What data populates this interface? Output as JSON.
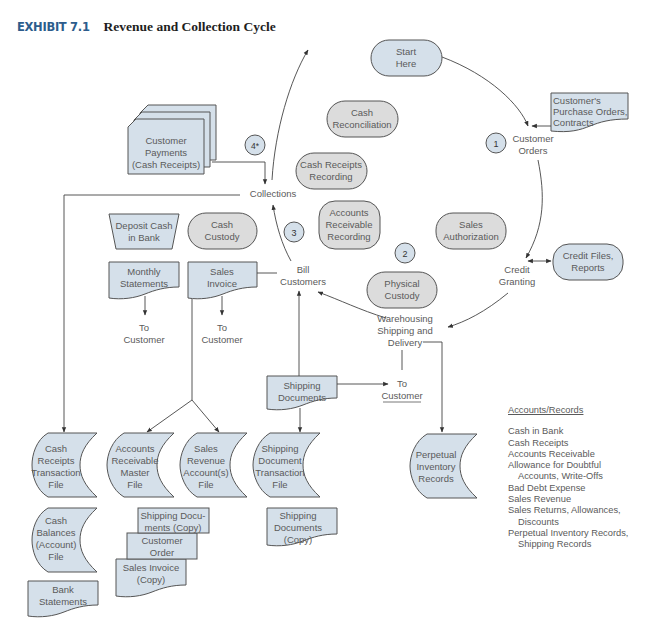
{
  "header": {
    "exhibit_label": "EXHIBIT 7.1",
    "title": "Revenue and Collection Cycle"
  },
  "colors": {
    "exhibit_blue": "#2c5c8c",
    "document_fill": "#d5e0ea",
    "process_fill": "#dcdcdc",
    "line": "#444444",
    "text": "#5a5a5a"
  },
  "cycle_steps": {
    "start": [
      "Start",
      "Here"
    ],
    "customer_orders": [
      "Customer",
      "Orders"
    ],
    "credit_granting": [
      "Credit",
      "Granting"
    ],
    "warehousing": [
      "Warehousing",
      "Shipping and",
      "Delivery"
    ],
    "bill_customers": [
      "Bill",
      "Customers"
    ],
    "collections": "Collections"
  },
  "step_numbers": {
    "n1": "1",
    "n2": "2",
    "n3": "3",
    "n4": "4*"
  },
  "functions": {
    "cash_reconciliation": [
      "Cash",
      "Reconciliation"
    ],
    "cash_receipts_recording": [
      "Cash Receipts",
      "Recording"
    ],
    "ar_recording": [
      "Accounts",
      "Receivable",
      "Recording"
    ],
    "sales_authorization": [
      "Sales",
      "Authorization"
    ],
    "physical_custody": [
      "Physical",
      "Custody"
    ],
    "cash_custody": [
      "Cash",
      "Custody"
    ]
  },
  "documents": {
    "customer_payments": [
      "Customer",
      "Payments",
      "(Cash Receipts)"
    ],
    "purchase_orders": [
      "Customer's",
      "Purchase Orders,",
      "Contracts"
    ],
    "credit_files": [
      "Credit Files,",
      "Reports"
    ],
    "deposit_cash": [
      "Deposit Cash",
      "in Bank"
    ],
    "monthly_statements": [
      "Monthly",
      "Statements"
    ],
    "sales_invoice": [
      "Sales",
      "Invoice"
    ],
    "shipping_documents": [
      "Shipping",
      "Documents"
    ],
    "shipping_docs_copy_a": [
      "Shipping Docu-",
      "ments (Copy)"
    ],
    "customer_order": [
      "Customer",
      "Order"
    ],
    "sales_invoice_copy": [
      "Sales Invoice",
      "(Copy)"
    ],
    "shipping_docs_copy_b": [
      "Shipping",
      "Documents",
      "(Copy)"
    ],
    "bank_statements": [
      "Bank",
      "Statements"
    ]
  },
  "destinations": {
    "to_customer_1": [
      "To",
      "Customer"
    ],
    "to_customer_2": [
      "To",
      "Customer"
    ],
    "to_customer_3": [
      "To",
      "Customer"
    ]
  },
  "files": {
    "cash_receipts_tf": [
      "Cash",
      "Receipts",
      "Transaction",
      "File"
    ],
    "ar_master": [
      "Accounts",
      "Receivable",
      "Master",
      "File"
    ],
    "sales_revenue": [
      "Sales",
      "Revenue",
      "Account(s)",
      "File"
    ],
    "shipping_doc_tf": [
      "Shipping",
      "Document",
      "Transaction",
      "File"
    ],
    "perpetual_inventory": [
      "Perpetual",
      "Inventory",
      "Records"
    ],
    "cash_balances": [
      "Cash",
      "Balances",
      "(Account)",
      "File"
    ]
  },
  "legend": {
    "heading": "Accounts/Records",
    "items": [
      {
        "text": "Cash in Bank",
        "indent": false
      },
      {
        "text": "Cash Receipts",
        "indent": false
      },
      {
        "text": "Accounts Receivable",
        "indent": false
      },
      {
        "text": "Allowance for Doubtful",
        "indent": false
      },
      {
        "text": "Accounts, Write-Offs",
        "indent": true
      },
      {
        "text": "Bad Debt Expense",
        "indent": false
      },
      {
        "text": "Sales Revenue",
        "indent": false
      },
      {
        "text": "Sales Returns, Allowances,",
        "indent": false
      },
      {
        "text": "Discounts",
        "indent": true
      },
      {
        "text": "Perpetual Inventory Records,",
        "indent": false
      },
      {
        "text": "Shipping Records",
        "indent": true
      }
    ]
  }
}
